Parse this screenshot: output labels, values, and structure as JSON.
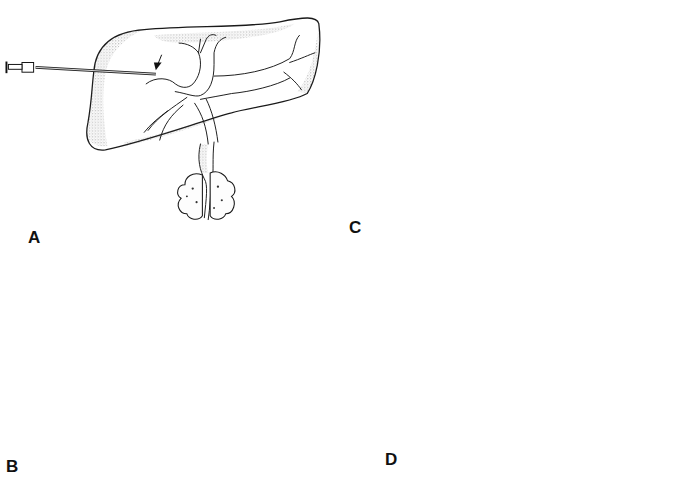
{
  "figure": {
    "colors": {
      "background": "#ffffff",
      "ink": "#111111",
      "stipple_shade": "#555555"
    }
  },
  "panels": [
    {
      "id": "A",
      "label": "A",
      "instrument": "needle-with-hub",
      "arrows": [
        {
          "type": "solid",
          "target": "needle-tip-in-duct"
        }
      ]
    },
    {
      "id": "B",
      "label": "B",
      "instrument": "guidewire-with-sheath-hub",
      "arrows": [
        {
          "type": "solid",
          "target": "wire-entry-in-duct"
        },
        {
          "type": "open",
          "target": "j-tip-in-common-bile-duct"
        }
      ]
    },
    {
      "id": "C",
      "label": "C",
      "instrument": "catheter-with-stopcock",
      "arrows": [
        {
          "type": "solid",
          "target": "catheter-in-duct"
        },
        {
          "type": "open",
          "target": "catheter-tip-in-common-bile-duct"
        }
      ]
    },
    {
      "id": "D",
      "label": "D",
      "instrument": "drainage-catheter-with-connector",
      "arrows": [
        {
          "type": "solid",
          "target": "side-hole-1"
        },
        {
          "type": "solid",
          "target": "side-hole-2"
        },
        {
          "type": "solid",
          "target": "side-hole-3"
        }
      ]
    }
  ]
}
